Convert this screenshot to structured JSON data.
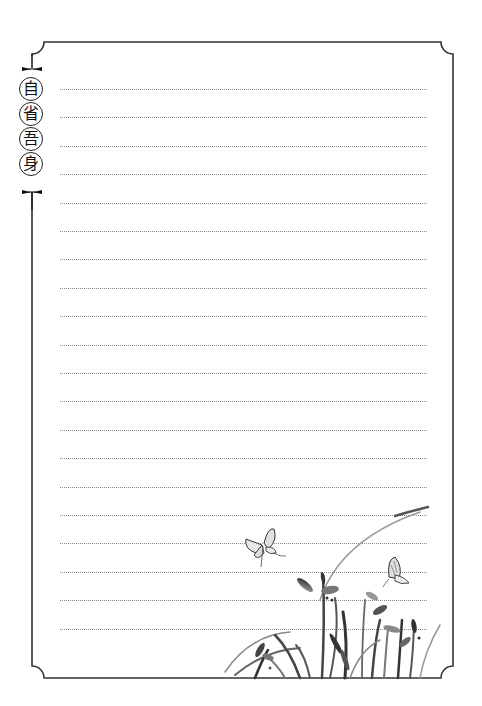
{
  "page": {
    "type": "lined stationery / notebook page",
    "background_color": "#ffffff",
    "border_color": "#333333",
    "line_color": "#8a8a8a"
  },
  "title": {
    "orientation": "vertical",
    "characters": [
      "自",
      "省",
      "吾",
      "身"
    ],
    "text": "自省吾身"
  },
  "ruled_lines": {
    "count": 20,
    "style": "dotted",
    "start_y": 89,
    "spacing": 28.4
  },
  "illustration": {
    "subject": "ink-wash grass and reeds with two butterflies",
    "position": "bottom-right",
    "elements": [
      "butterfly-left",
      "butterfly-right",
      "grass-cluster"
    ]
  }
}
